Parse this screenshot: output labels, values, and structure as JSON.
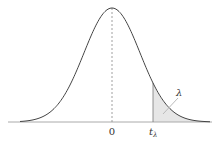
{
  "diagram": {
    "type": "normal-distribution-curve",
    "labels": {
      "zero": "0",
      "t_main": "t",
      "t_sub": "λ",
      "lambda": "λ"
    },
    "colors": {
      "curve": "#444444",
      "axis": "#aaaaaa",
      "mean_line": "#888888",
      "tail_fill": "#e6e6e6",
      "leader_line": "#bbbbbb"
    }
  }
}
